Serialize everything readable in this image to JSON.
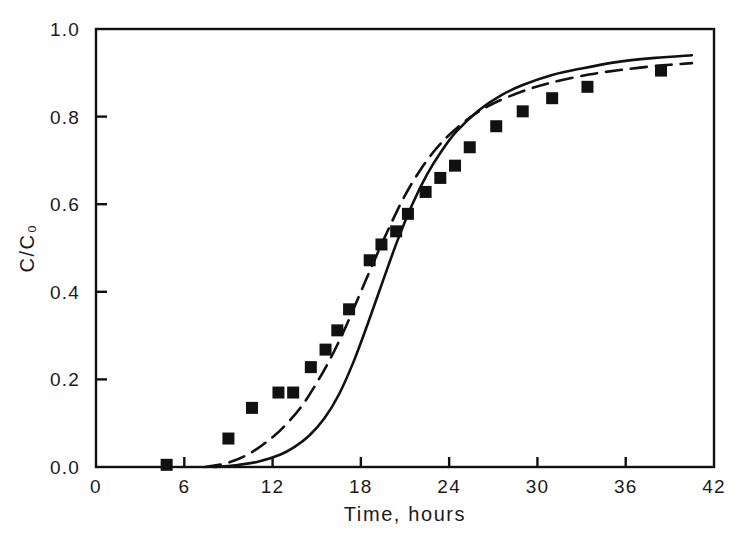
{
  "chart_data": {
    "type": "scatter",
    "title": "",
    "xlabel": "Time, hours",
    "ylabel": "C/C₀",
    "xlim": [
      0,
      42
    ],
    "ylim": [
      0.0,
      1.0
    ],
    "xticks": [
      0,
      6,
      12,
      18,
      24,
      30,
      36,
      42
    ],
    "xtick_labels": [
      "0",
      "6",
      "12",
      "18",
      "24",
      "30",
      "36",
      "42"
    ],
    "yticks": [
      0.0,
      0.2,
      0.4,
      0.6,
      0.8,
      1.0
    ],
    "ytick_labels": [
      "0.0",
      "0.2",
      "0.4",
      "0.6",
      "0.8",
      "1.0"
    ],
    "grid": false,
    "legend": "none",
    "frame": "box",
    "series": [
      {
        "name": "experimental data",
        "type": "scatter",
        "marker": "filled-square",
        "color": "#111111",
        "points": [
          {
            "x": 4.8,
            "y": 0.005
          },
          {
            "x": 9.0,
            "y": 0.065
          },
          {
            "x": 10.6,
            "y": 0.135
          },
          {
            "x": 12.4,
            "y": 0.17
          },
          {
            "x": 13.4,
            "y": 0.17
          },
          {
            "x": 14.6,
            "y": 0.228
          },
          {
            "x": 15.6,
            "y": 0.268
          },
          {
            "x": 16.4,
            "y": 0.312
          },
          {
            "x": 17.2,
            "y": 0.36
          },
          {
            "x": 18.6,
            "y": 0.472
          },
          {
            "x": 19.4,
            "y": 0.508
          },
          {
            "x": 20.4,
            "y": 0.538
          },
          {
            "x": 21.2,
            "y": 0.578
          },
          {
            "x": 22.4,
            "y": 0.628
          },
          {
            "x": 23.4,
            "y": 0.66
          },
          {
            "x": 24.4,
            "y": 0.688
          },
          {
            "x": 25.4,
            "y": 0.73
          },
          {
            "x": 27.2,
            "y": 0.778
          },
          {
            "x": 29.0,
            "y": 0.812
          },
          {
            "x": 31.0,
            "y": 0.842
          },
          {
            "x": 33.4,
            "y": 0.868
          },
          {
            "x": 38.4,
            "y": 0.905
          }
        ]
      },
      {
        "name": "model curve A",
        "type": "line",
        "style": "solid",
        "color": "#111111",
        "points": [
          {
            "x": 8.0,
            "y": 0.0
          },
          {
            "x": 9.5,
            "y": 0.004
          },
          {
            "x": 11.0,
            "y": 0.012
          },
          {
            "x": 12.5,
            "y": 0.028
          },
          {
            "x": 13.5,
            "y": 0.046
          },
          {
            "x": 14.5,
            "y": 0.072
          },
          {
            "x": 15.5,
            "y": 0.11
          },
          {
            "x": 16.5,
            "y": 0.165
          },
          {
            "x": 17.5,
            "y": 0.24
          },
          {
            "x": 18.5,
            "y": 0.33
          },
          {
            "x": 19.5,
            "y": 0.425
          },
          {
            "x": 20.5,
            "y": 0.518
          },
          {
            "x": 21.5,
            "y": 0.6
          },
          {
            "x": 22.5,
            "y": 0.668
          },
          {
            "x": 23.5,
            "y": 0.722
          },
          {
            "x": 24.5,
            "y": 0.766
          },
          {
            "x": 26.0,
            "y": 0.814
          },
          {
            "x": 27.5,
            "y": 0.848
          },
          {
            "x": 29.0,
            "y": 0.872
          },
          {
            "x": 31.0,
            "y": 0.895
          },
          {
            "x": 33.0,
            "y": 0.91
          },
          {
            "x": 35.5,
            "y": 0.925
          },
          {
            "x": 38.0,
            "y": 0.934
          },
          {
            "x": 40.5,
            "y": 0.94
          }
        ]
      },
      {
        "name": "model curve B",
        "type": "line",
        "style": "dashed",
        "color": "#111111",
        "points": [
          {
            "x": 7.4,
            "y": 0.0
          },
          {
            "x": 9.0,
            "y": 0.01
          },
          {
            "x": 10.5,
            "y": 0.032
          },
          {
            "x": 12.0,
            "y": 0.068
          },
          {
            "x": 13.0,
            "y": 0.1
          },
          {
            "x": 14.0,
            "y": 0.14
          },
          {
            "x": 15.0,
            "y": 0.192
          },
          {
            "x": 16.0,
            "y": 0.252
          },
          {
            "x": 17.0,
            "y": 0.322
          },
          {
            "x": 18.0,
            "y": 0.4
          },
          {
            "x": 19.0,
            "y": 0.478
          },
          {
            "x": 20.0,
            "y": 0.552
          },
          {
            "x": 21.0,
            "y": 0.62
          },
          {
            "x": 22.0,
            "y": 0.676
          },
          {
            "x": 23.0,
            "y": 0.722
          },
          {
            "x": 24.0,
            "y": 0.758
          },
          {
            "x": 25.5,
            "y": 0.8
          },
          {
            "x": 27.0,
            "y": 0.83
          },
          {
            "x": 29.0,
            "y": 0.858
          },
          {
            "x": 31.0,
            "y": 0.878
          },
          {
            "x": 33.5,
            "y": 0.896
          },
          {
            "x": 36.0,
            "y": 0.908
          },
          {
            "x": 38.5,
            "y": 0.917
          },
          {
            "x": 40.5,
            "y": 0.922
          }
        ]
      }
    ]
  },
  "axes": {
    "x_title": "Time, hours",
    "y_title": "C/C₀"
  }
}
